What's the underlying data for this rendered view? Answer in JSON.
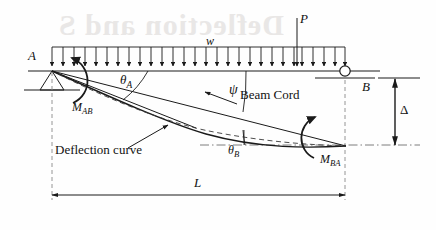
{
  "figure": {
    "kind": "structural-beam-diagram",
    "title_visible": false,
    "width": 436,
    "height": 230,
    "background_color": "#fefefe",
    "line_color": "#1a1a1a",
    "watermark_color": "#e9e7e6"
  },
  "labels": {
    "support_a": "A",
    "support_b": "B",
    "distributed_load": "w",
    "point_load": "P",
    "theta_a": "θ",
    "theta_a_sub": "A",
    "theta_b": "θ",
    "theta_b_sub": "B",
    "psi": "ψ",
    "moment_ab": "M",
    "moment_ab_sub": "AB",
    "moment_ba": "M",
    "moment_ba_sub": "BA",
    "beam_cord": "Beam Cord",
    "deflection_curve": "Deflection curve",
    "span": "L",
    "delta": "Δ"
  },
  "watermark": {
    "text": "Deflection and S",
    "note": "faint bleed-through text behind the figure"
  },
  "geometry": {
    "beam_left_x": 52,
    "beam_right_x": 345,
    "beam_y": 71,
    "load_bar_y": 47,
    "support_a_x": 52,
    "support_a_y": 71,
    "support_b_x": 345,
    "support_b_y": 71,
    "end_b_deflected_x": 345,
    "end_b_deflected_y": 145,
    "point_load_x": 297,
    "span_dim_y": 195,
    "delta_dim_x": 395,
    "delta_top_y": 78,
    "delta_bottom_y": 145
  },
  "load_arrows": {
    "count": 27,
    "start_x": 52,
    "end_x": 345,
    "top_y": 47,
    "tip_y": 71
  }
}
